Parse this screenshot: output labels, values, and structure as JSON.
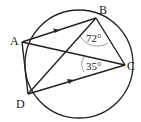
{
  "diagram": {
    "type": "cyclic-quadrilateral",
    "points": {
      "A": {
        "label": "A"
      },
      "B": {
        "label": "B"
      },
      "C": {
        "label": "C"
      },
      "D": {
        "label": "D"
      }
    },
    "angles": {
      "at_B": "72°",
      "at_C": "35°"
    },
    "parallel_marks": [
      "AB",
      "DC"
    ],
    "segments": [
      "AB",
      "BC",
      "AC",
      "BD",
      "AD",
      "DC"
    ]
  }
}
